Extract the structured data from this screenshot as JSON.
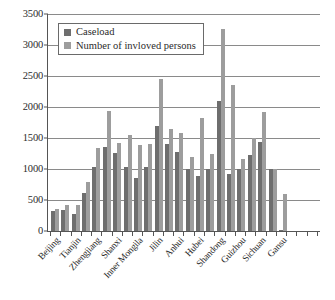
{
  "chart_data": {
    "type": "bar",
    "title": "",
    "subtitle": "",
    "xlabel": "",
    "ylabel": "",
    "ylim": [
      0,
      3500
    ],
    "ytick_values": [
      0,
      500,
      1000,
      1500,
      2000,
      2500,
      3000,
      3500
    ],
    "ytick_labels": [
      "0",
      "500",
      "1000",
      "1500",
      "2000",
      "2500",
      "3000",
      "3500"
    ],
    "grid": true,
    "legend_position": "upper-left-inside",
    "categories": [
      "Beijing",
      "Hebei",
      "Tianjin",
      "Liaoning",
      "Zhengjiang",
      "Jiangsu",
      "Shanxi",
      "Henan",
      "Inner Mongila",
      "Heilongjiang",
      "Jilin",
      "Shanghai",
      "Anhui",
      "Jiangxi",
      "Hubei",
      "Hunan",
      "Shandong",
      "Guangdong",
      "Guizhou",
      "Yunnan",
      "Sichuan",
      "Shaanxi",
      "Gansu",
      "Qinghai",
      "Ningxia",
      "Xinjiang"
    ],
    "tick_labels_shown": [
      "Beijing",
      "",
      "Tianjin",
      "",
      "Zhengjiang",
      "",
      "Shanxi",
      "",
      "Inner Mongila",
      "",
      "Jilin",
      "",
      "Anhui",
      "",
      "Hubei",
      "",
      "Shandong",
      "",
      "Guizhou",
      "",
      "Sichuan",
      "",
      "Gansu",
      "",
      "",
      ""
    ],
    "series": [
      {
        "name": "Caseload",
        "color": "#6e6e6e",
        "values": [
          320,
          330,
          275,
          605,
          1035,
          1350,
          1245,
          1030,
          845,
          1035,
          1680,
          1390,
          1275,
          1000,
          885,
          990,
          2080,
          920,
          1000,
          1215,
          1435,
          1000,
          20,
          0,
          0,
          0
        ]
      },
      {
        "name": "Number of invloved persons",
        "color": "#9d9d9d",
        "values": [
          355,
          415,
          415,
          780,
          1340,
          1930,
          1420,
          1535,
          1380,
          1400,
          2440,
          1640,
          1570,
          1185,
          1820,
          1230,
          3250,
          2340,
          1155,
          1495,
          1915,
          1000,
          590,
          0,
          0,
          0
        ]
      }
    ]
  },
  "legend": {
    "items": [
      {
        "label": "Caseload",
        "swatch": "#6e6e6e"
      },
      {
        "label": "Number of invloved persons",
        "swatch": "#9d9d9d"
      }
    ]
  }
}
